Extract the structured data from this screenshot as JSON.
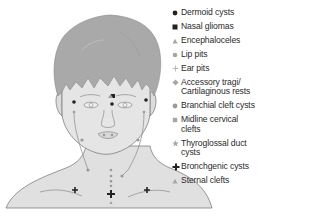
{
  "diagram": {
    "colors": {
      "hair": "#a9a9a9",
      "skin": "#e3e3e3",
      "outline": "#7a7a7a",
      "dark_marker": "#222222",
      "light_marker": "#9a9a9a",
      "text": "#2b2b2b"
    }
  },
  "legend": {
    "items": [
      {
        "icon": "filled-circle-dark",
        "label": "Dermoid cysts"
      },
      {
        "icon": "filled-square-dark",
        "label": "Nasal gliomas"
      },
      {
        "icon": "triangle-light",
        "label": "Encephaloceles"
      },
      {
        "icon": "circle-light",
        "label": "Lip pits"
      },
      {
        "icon": "plus-thin-light",
        "label": "Ear pits"
      },
      {
        "icon": "diamond-light",
        "label": "Accessory tragi/\nCartilaginous rests"
      },
      {
        "icon": "circle-grey",
        "label": "Branchial cleft cysts"
      },
      {
        "icon": "square-light",
        "label": "Midline cervical\nclefts"
      },
      {
        "icon": "star-light",
        "label": "Thyroglossal duct\ncysts"
      },
      {
        "icon": "cross-bold-dark",
        "label": "Bronchgenic cysts"
      },
      {
        "icon": "triangle-light",
        "label": "Sternal clefts"
      }
    ]
  }
}
